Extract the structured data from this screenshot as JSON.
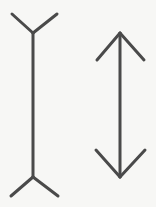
{
  "figure": {
    "type": "line-drawing",
    "background_color": "#f7f7f5",
    "stroke_color": "#4a4a4a",
    "stroke_width": 3,
    "canvas": {
      "width": 156,
      "height": 207
    },
    "shapes": [
      {
        "name": "fins-outward-figure",
        "description": "Vertical shaft with outward-pointing fins (Y on top, inverted V on bottom)",
        "shaft": {
          "x": 33,
          "y_top": 33,
          "y_bottom": 177,
          "length": 144
        },
        "fins": [
          {
            "name": "top-left-fin",
            "x1": 33,
            "y1": 33,
            "x2": 12,
            "y2": 14
          },
          {
            "name": "top-right-fin",
            "x1": 33,
            "y1": 33,
            "x2": 57,
            "y2": 14
          },
          {
            "name": "bottom-left-fin",
            "x1": 33,
            "y1": 177,
            "x2": 11,
            "y2": 196
          },
          {
            "name": "bottom-right-fin",
            "x1": 33,
            "y1": 177,
            "x2": 58,
            "y2": 196
          }
        ]
      },
      {
        "name": "arrowheads-inward-figure",
        "description": "Vertical shaft with inward-pointing arrowheads (double-headed arrow)",
        "shaft": {
          "x": 120,
          "y_top": 33,
          "y_bottom": 177,
          "length": 144
        },
        "fins": [
          {
            "name": "top-left-arrowhead",
            "x1": 120,
            "y1": 33,
            "x2": 97,
            "y2": 60
          },
          {
            "name": "top-right-arrowhead",
            "x1": 120,
            "y1": 33,
            "x2": 144,
            "y2": 60
          },
          {
            "name": "bottom-left-arrowhead",
            "x1": 120,
            "y1": 177,
            "x2": 96,
            "y2": 150
          },
          {
            "name": "bottom-right-arrowhead",
            "x1": 120,
            "y1": 177,
            "x2": 145,
            "y2": 150
          }
        ]
      }
    ]
  }
}
